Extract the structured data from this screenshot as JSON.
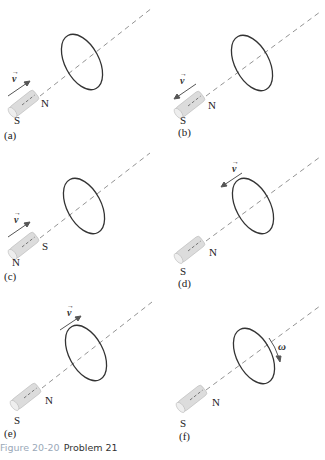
{
  "figure": {
    "caption_label": "Figure 20-20",
    "caption_text": "Problem 21",
    "caption_label_color": "#9aa8b8",
    "loop_color": "#333333",
    "axis_color": "#777777",
    "arrow_color": "#555555"
  },
  "panels": [
    {
      "id": "a",
      "tag": "(a)",
      "left_pole": "S",
      "right_pole": "N",
      "velocity": "v",
      "motion": "magnet toward loop"
    },
    {
      "id": "b",
      "tag": "(b)",
      "left_pole": "S",
      "right_pole": "N",
      "velocity": "v",
      "motion": "magnet away from loop"
    },
    {
      "id": "c",
      "tag": "(c)",
      "left_pole": "N",
      "right_pole": "S",
      "velocity": "v",
      "motion": "magnet toward loop"
    },
    {
      "id": "d",
      "tag": "(d)",
      "left_pole": "S",
      "right_pole": "N",
      "velocity": "v",
      "motion": "loop toward magnet"
    },
    {
      "id": "e",
      "tag": "(e)",
      "left_pole": "S",
      "right_pole": "N",
      "velocity": "v",
      "motion": "loop away from magnet"
    },
    {
      "id": "f",
      "tag": "(f)",
      "left_pole": "S",
      "right_pole": "N",
      "velocity": "ω",
      "motion": "loop rotating"
    }
  ]
}
